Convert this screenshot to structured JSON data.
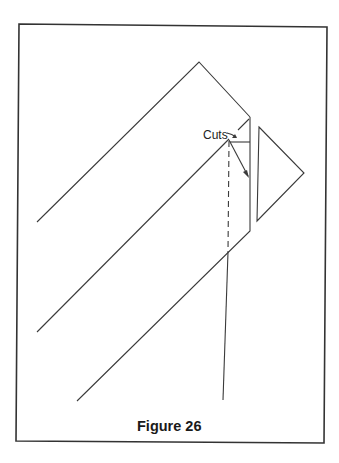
{
  "diagram": {
    "label_cuts": "Cuts",
    "caption": "Figure 26",
    "stroke_color": "#3a3a3a"
  }
}
